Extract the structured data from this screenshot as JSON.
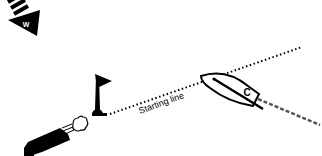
{
  "diagram": {
    "labels": {
      "starting_line": "Starting line",
      "boat": "C",
      "wind": "W"
    },
    "elements": {
      "wind_arrow": {
        "meaning": "wind direction",
        "icon": "wind-arrow-icon"
      },
      "flag_mark": {
        "meaning": "committee / pin end flag",
        "icon": "flag-icon"
      },
      "cannon": {
        "meaning": "starting signal cannon",
        "icon": "cannon-icon"
      },
      "boat": {
        "meaning": "boat C crossing starting line",
        "icon": "sailboat-icon"
      },
      "starting_line": {
        "style": "dotted"
      },
      "boat_track": {
        "style": "dashed"
      }
    },
    "colors": {
      "ink": "#000000",
      "track": "#555555",
      "background": "#ffffff"
    }
  }
}
